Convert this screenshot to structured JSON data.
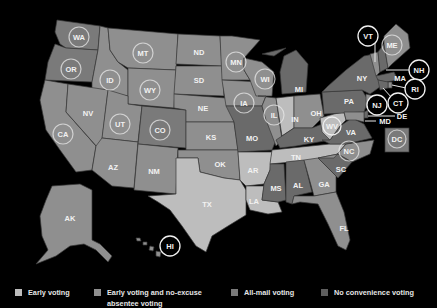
{
  "legend": [
    {
      "label": "Early voting",
      "color": "#bdbdbd"
    },
    {
      "label": "Early voting and no-excuse absentee voting",
      "label_line1": "Early voting and no-excuse",
      "label_line2": "absentee voting",
      "color": "#8f8f8f"
    },
    {
      "label": "All-mail voting",
      "color": "#7a7a7a"
    },
    {
      "label": "No convenience voting",
      "color": "#5e5e5e"
    }
  ],
  "colors": {
    "background": "#000000",
    "early": "#bdbdbd",
    "early_noexcuse": "#8f8f8f",
    "allmail": "#7a7a7a",
    "none": "#5e5e5e"
  },
  "states": {
    "WA": "WA",
    "OR": "OR",
    "CA": "CA",
    "ID": "ID",
    "NV": "NV",
    "MT": "MT",
    "WY": "WY",
    "UT": "UT",
    "AZ": "AZ",
    "CO": "CO",
    "NM": "NM",
    "ND": "ND",
    "SD": "SD",
    "NE": "NE",
    "KS": "KS",
    "OK": "OK",
    "TX": "TX",
    "MN": "MN",
    "IA": "IA",
    "MO": "MO",
    "AR": "AR",
    "LA": "LA",
    "WI": "WI",
    "IL": "IL",
    "MI": "MI",
    "IN": "IN",
    "OH": "OH",
    "KY": "KY",
    "TN": "TN",
    "MS": "MS",
    "AL": "AL",
    "GA": "GA",
    "FL": "FL",
    "SC": "SC",
    "NC": "NC",
    "VA": "VA",
    "WV": "WV",
    "PA": "PA",
    "NY": "NY",
    "VT": "VT",
    "NH": "NH",
    "ME": "ME",
    "MA": "MA",
    "RI": "RI",
    "CT": "CT",
    "NJ": "NJ",
    "DE": "DE",
    "MD": "MD",
    "DC": "DC",
    "AK": "AK",
    "HI": "HI"
  }
}
